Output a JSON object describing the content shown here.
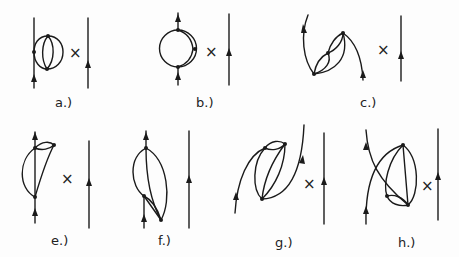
{
  "figure": {
    "type": "feynman-diagram-set",
    "panels": [
      {
        "id": "a",
        "label": "a.)",
        "times": "×"
      },
      {
        "id": "b",
        "label": "b.)",
        "times": "×"
      },
      {
        "id": "c",
        "label": "c.)",
        "times": "×"
      },
      {
        "id": "e",
        "label": "e.)",
        "times": "×"
      },
      {
        "id": "f",
        "label": "f.)",
        "times": ""
      },
      {
        "id": "g",
        "label": "g.)",
        "times": "×"
      },
      {
        "id": "h",
        "label": "h.)",
        "times": "×"
      }
    ]
  }
}
